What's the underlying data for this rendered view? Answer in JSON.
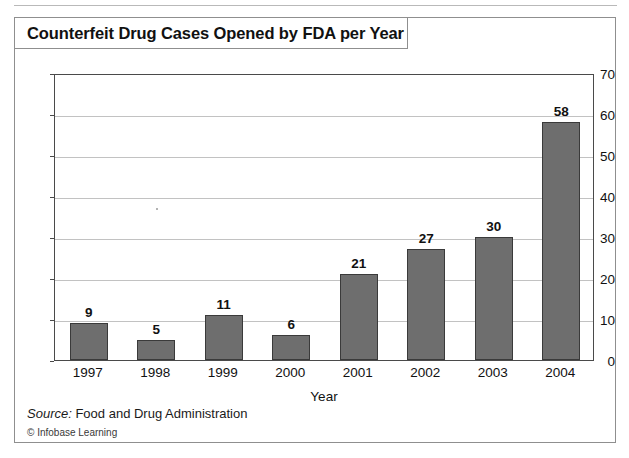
{
  "figure": {
    "title": "Counterfeit Drug Cases Opened by FDA per Year",
    "source_label": "Source:",
    "source_text": " Food and Drug Administration",
    "copyright": "© Infobase Learning"
  },
  "chart_data": {
    "type": "bar",
    "title": "Counterfeit Drug Cases Opened by FDA per Year",
    "categories": [
      "1997",
      "1998",
      "1999",
      "2000",
      "2001",
      "2002",
      "2003",
      "2004"
    ],
    "values": [
      9,
      5,
      11,
      6,
      21,
      27,
      30,
      58
    ],
    "value_labels": [
      "9",
      "5",
      "11",
      "6",
      "21",
      "27",
      "30",
      "58"
    ],
    "xlabel": "Year",
    "ylabel": "",
    "ylim": [
      0,
      70
    ],
    "yticks": [
      0,
      10,
      20,
      30,
      40,
      50,
      60,
      70
    ],
    "ytick_labels": [
      "0",
      "10",
      "20",
      "30",
      "40",
      "50",
      "60",
      "70"
    ],
    "grid": true,
    "legend": false,
    "bar_color": "#6e6e6e",
    "bar_border_color": "#3a3a3a",
    "gridline_color": "#c2c2c2",
    "axis_color": "#4a4a4a",
    "background": "#ffffff"
  }
}
